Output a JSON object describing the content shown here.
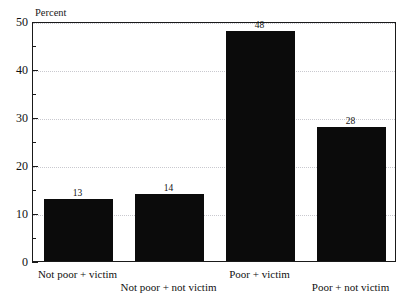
{
  "figure": {
    "unit_caption": "Percent",
    "cropped_title_fragment": "",
    "bar_color": "#0b0b0b",
    "frame_color": "#1a1a1a",
    "grid_color": "#c9c9cf"
  },
  "chart_data": {
    "type": "bar",
    "title": "",
    "xlabel": "",
    "ylabel": "Percent",
    "ylim": [
      0,
      50
    ],
    "yticks": [
      0,
      10,
      20,
      30,
      40,
      50
    ],
    "ytick_labels": [
      "0",
      "10",
      "20",
      "30",
      "40",
      "50"
    ],
    "yminor_ticks": [
      5,
      15,
      25,
      35,
      45
    ],
    "grid": "horizontal-dotted-at-major-ticks",
    "legend": "none",
    "categories": [
      "Not poor + victim",
      "Not poor + not victim",
      "Poor + victim",
      "Poor + not victim"
    ],
    "values": [
      13,
      14,
      48,
      28
    ],
    "value_labels": [
      "13",
      "14",
      "48",
      "28"
    ],
    "category_label_layout": "staggered-two-rows"
  }
}
